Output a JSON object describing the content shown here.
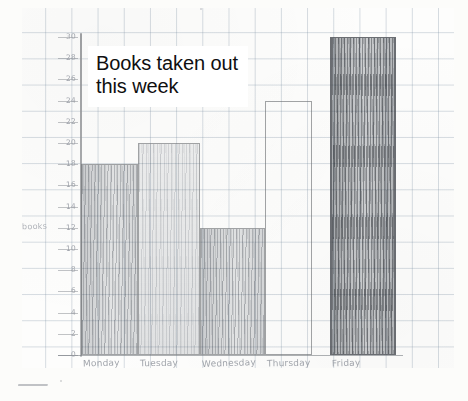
{
  "chart_data": {
    "type": "bar",
    "title": "Books taken out this week",
    "title_line1": "Books taken out",
    "title_line2": "this week",
    "categories": [
      "Monday",
      "Tuesday",
      "Wednesday",
      "Thursday",
      "Friday"
    ],
    "values": [
      18,
      20,
      12,
      24,
      30
    ],
    "xlabel": "",
    "ylabel": "books",
    "ylim": [
      0,
      30
    ],
    "ytick_step": 2,
    "yticks": [
      0,
      2,
      4,
      6,
      8,
      10,
      12,
      14,
      16,
      18,
      20,
      22,
      24,
      26,
      28,
      30
    ],
    "ytick_labels": [
      "0",
      "2",
      "4",
      "6",
      "8",
      "10",
      "12",
      "14",
      "16",
      "18",
      "20",
      "22",
      "24",
      "26",
      "28",
      "30"
    ],
    "grid": true,
    "legend": "none",
    "medium": "hand-drawn pencil on graph paper",
    "bar_shading": [
      "medium",
      "light",
      "medium",
      "outline-only",
      "dark"
    ]
  },
  "colors": {
    "paper": "#fdfdfc",
    "grid_line": "#7a8ca0",
    "pencil": "#6a6e74",
    "pencil_dark": "#46494f",
    "axis_label": "#9ca0a7",
    "title_text": "#0f0f10",
    "title_bg": "#ffffff"
  }
}
